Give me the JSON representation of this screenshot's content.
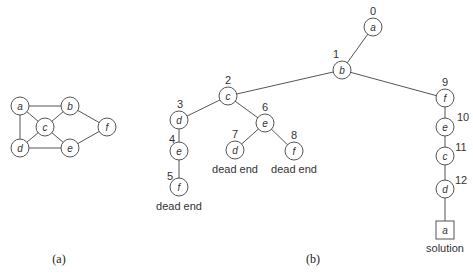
{
  "graph_a": {
    "caption": "(a)",
    "nodes": [
      {
        "id": "a",
        "label": "a",
        "x": 20,
        "y": 106
      },
      {
        "id": "b",
        "label": "b",
        "x": 70,
        "y": 106
      },
      {
        "id": "c",
        "label": "c",
        "x": 45,
        "y": 127
      },
      {
        "id": "d",
        "label": "d",
        "x": 20,
        "y": 148
      },
      {
        "id": "e",
        "label": "e",
        "x": 70,
        "y": 148
      },
      {
        "id": "f",
        "label": "f",
        "x": 107,
        "y": 127
      }
    ],
    "edges": [
      [
        "a",
        "b"
      ],
      [
        "a",
        "c"
      ],
      [
        "a",
        "d"
      ],
      [
        "b",
        "c"
      ],
      [
        "b",
        "f"
      ],
      [
        "c",
        "d"
      ],
      [
        "c",
        "e"
      ],
      [
        "d",
        "e"
      ],
      [
        "e",
        "f"
      ]
    ]
  },
  "tree_b": {
    "caption": "(b)",
    "nodes": [
      {
        "id": "n0",
        "label": "a",
        "order": "0",
        "x": 373,
        "y": 27,
        "nx": 373,
        "ny": 11
      },
      {
        "id": "n1",
        "label": "b",
        "order": "1",
        "x": 342,
        "y": 70,
        "nx": 336,
        "ny": 54
      },
      {
        "id": "n2",
        "label": "c",
        "order": "2",
        "x": 228,
        "y": 96,
        "nx": 228,
        "ny": 80
      },
      {
        "id": "n3",
        "label": "d",
        "order": "3",
        "x": 179,
        "y": 120,
        "nx": 180,
        "ny": 104
      },
      {
        "id": "n4",
        "label": "e",
        "order": "4",
        "x": 179,
        "y": 151,
        "nx": 172,
        "ny": 139
      },
      {
        "id": "n5",
        "label": "f",
        "order": "5",
        "x": 179,
        "y": 187,
        "nx": 170,
        "ny": 176
      },
      {
        "id": "n6",
        "label": "e",
        "order": "6",
        "x": 265,
        "y": 123,
        "nx": 265,
        "ny": 107
      },
      {
        "id": "n7",
        "label": "d",
        "order": "7",
        "x": 235,
        "y": 150,
        "nx": 235,
        "ny": 134
      },
      {
        "id": "n8",
        "label": "f",
        "order": "8",
        "x": 294,
        "y": 151,
        "nx": 294,
        "ny": 135
      },
      {
        "id": "n9",
        "label": "f",
        "order": "9",
        "x": 445,
        "y": 98,
        "nx": 445,
        "ny": 82
      },
      {
        "id": "n10",
        "label": "e",
        "order": "10",
        "x": 445,
        "y": 127,
        "nx": 463,
        "ny": 117
      },
      {
        "id": "n11",
        "label": "c",
        "order": "11",
        "x": 445,
        "y": 156,
        "nx": 461,
        "ny": 147
      },
      {
        "id": "n12",
        "label": "d",
        "order": "12",
        "x": 445,
        "y": 189,
        "nx": 461,
        "ny": 180
      }
    ],
    "edges": [
      [
        "n0",
        "n1"
      ],
      [
        "n1",
        "n2"
      ],
      [
        "n1",
        "n9"
      ],
      [
        "n2",
        "n3"
      ],
      [
        "n2",
        "n6"
      ],
      [
        "n3",
        "n4"
      ],
      [
        "n4",
        "n5"
      ],
      [
        "n6",
        "n7"
      ],
      [
        "n6",
        "n8"
      ],
      [
        "n9",
        "n10"
      ],
      [
        "n10",
        "n11"
      ],
      [
        "n11",
        "n12"
      ]
    ],
    "solution": {
      "label": "a",
      "x": 445,
      "y": 230,
      "note": "solution"
    },
    "dead_end_label": "dead end",
    "dead_ends": [
      {
        "x": 179,
        "y": 206
      },
      {
        "x": 235,
        "y": 169
      },
      {
        "x": 294,
        "y": 169
      }
    ]
  }
}
